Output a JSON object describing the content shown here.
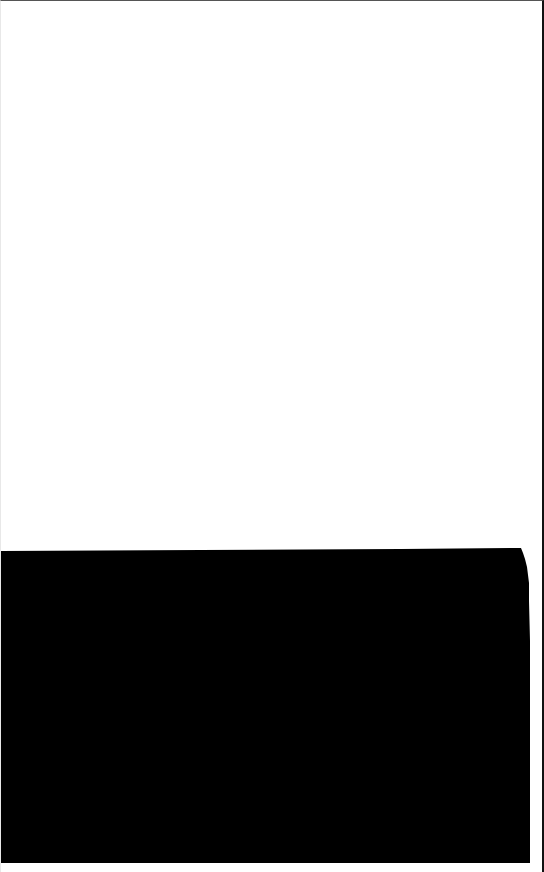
{
  "canvas": {
    "width": 544,
    "height": 872,
    "background": "#ffffff"
  },
  "regions": [
    {
      "name": "blank-white-area",
      "color": "#ffffff"
    },
    {
      "name": "black-fill-area",
      "color": "#000000"
    }
  ],
  "colors": {
    "top_border": "#555555",
    "right_border": "#111111",
    "fill": "#000000",
    "background": "#ffffff"
  }
}
